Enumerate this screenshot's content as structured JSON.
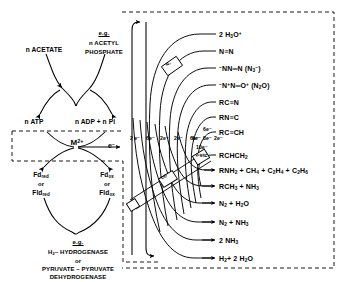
{
  "diagram": {
    "left_panel": {
      "substrate": "n ACETATE",
      "eg_label_top": "e.g.",
      "eg_example_top_line1": "n ACETYL",
      "eg_example_top_line2": "PHOSPHATE",
      "atp": "n ATP",
      "adp": "n ADP + n Pi",
      "metal": "M",
      "metal_charge": "2+",
      "electron": "e",
      "electron_charge": "−",
      "fd_red_line1": "Fd",
      "fd_red_sub1": "red",
      "fd_red_or": "or",
      "fd_red_line2": "Fld",
      "fd_red_sub2": "red",
      "fd_ox_line1": "Fd",
      "fd_ox_sub1": "ox",
      "fd_ox_or": "or",
      "fd_ox_line2": "Fld",
      "fd_ox_sub2": "ox",
      "eg_label_bottom": "e.g.",
      "enzyme_line1_a": "H",
      "enzyme_line1_sub": "2",
      "enzyme_line1_b": "– HYDROGENASE",
      "enzyme_or": "or",
      "enzyme_line2": "PYRUVATE – PYRUVATE",
      "enzyme_line3": "DEHYDROGENASE"
    },
    "right_panel": {
      "electron_counts_outer": [
        "2 e⁻",
        "6e⁻",
        "2e⁻",
        "2e⁻",
        "6e⁻"
      ],
      "electron_counts_inner": [
        "6e⁻",
        "6e⁻",
        "8e⁻",
        "2e⁻",
        "10e⁻",
        "etc"
      ],
      "band_boxes": [
        "N₂",
        "CO",
        "H₂"
      ],
      "products": [
        {
          "id": "hydronium",
          "html": "2 H<sub>3</sub>O<sup>+</sup>"
        },
        {
          "id": "dinitrogen",
          "html": "N≡N"
        },
        {
          "id": "azide",
          "html": "<sup class=\"minus\">−</sup>NN═N (N<sub>3</sub><sup>−</sup>)"
        },
        {
          "id": "nitrous-oxide",
          "html": "<sup class=\"minus\">−</sup>N<sup>+</sup>N═O<sup>+</sup> (N<sub>2</sub>O)"
        },
        {
          "id": "nitrile",
          "html": "RC≡N"
        },
        {
          "id": "isocyanide",
          "html": "RN≡C"
        },
        {
          "id": "alkyne",
          "html": "RC≡CH"
        },
        {
          "id": "alkene",
          "html": "RCHCH<sub>2</sub>"
        },
        {
          "id": "amine-alkanes",
          "html": "RNH<sub>2</sub> + CH<sub>4</sub> + C<sub>2</sub>H<sub>4</sub> + C<sub>2</sub>H<sub>6</sub>"
        },
        {
          "id": "alkane-ammonia",
          "html": "RCH<sub>3</sub> + NH<sub>3</sub>"
        },
        {
          "id": "n2-water",
          "html": "N<sub>2</sub> + H<sub>2</sub>O"
        },
        {
          "id": "n2-ammonia",
          "html": "N<sub>2</sub> + NH<sub>3</sub>"
        },
        {
          "id": "ammonia",
          "html": "2 NH<sub>3</sub>"
        },
        {
          "id": "hydrogen-water",
          "html": "H<sub>2</sub>+ 2 H<sub>2</sub>O"
        }
      ]
    }
  }
}
